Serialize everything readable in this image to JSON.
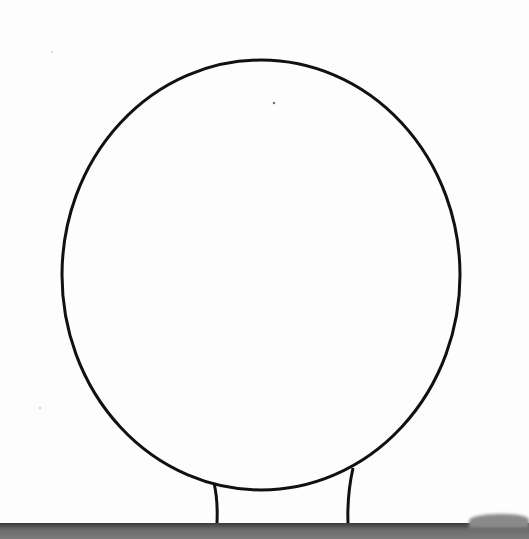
{
  "figure": {
    "stroke_color": "#111111",
    "background_color": "#fdfdfd",
    "ground_color": "#555555",
    "head": {
      "cx": 261,
      "cy": 275,
      "rx": 199,
      "ry": 215
    },
    "neck": {
      "left": {
        "x_top": 214,
        "y_top": 483,
        "x_bottom": 217,
        "y_bottom": 523
      },
      "right": {
        "x_top": 353,
        "y_top": 468,
        "x_bottom": 348,
        "y_bottom": 523
      }
    }
  }
}
